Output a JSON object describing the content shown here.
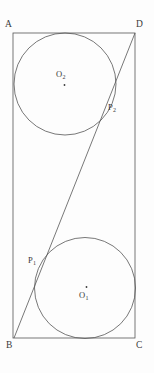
{
  "figure": {
    "type": "geometry-diagram",
    "background_color": "#fdfdfd",
    "stroke_color": "#555555",
    "stroke_width": 0.8,
    "text_color": "#3a3a3a",
    "canvas": {
      "width": 154,
      "height": 373
    }
  },
  "rectangle": {
    "name": "ABCD",
    "corners": {
      "A": {
        "x": 13,
        "y": 33
      },
      "D": {
        "x": 135,
        "y": 33
      },
      "C": {
        "x": 135,
        "y": 338
      },
      "B": {
        "x": 14,
        "y": 338
      }
    },
    "width": 122,
    "height": 305
  },
  "diagonal": {
    "name": "BD",
    "from": "B",
    "to": "D",
    "x1": 14,
    "y1": 338,
    "x2": 135,
    "y2": 33
  },
  "circles": [
    {
      "id": "O2",
      "label": "O",
      "subscript": "2",
      "cx": 65,
      "cy": 84,
      "r": 51,
      "tangent_to": [
        "AB",
        "AD",
        "BD"
      ],
      "center_dot": {
        "x": 64.5,
        "y": 85
      }
    },
    {
      "id": "O1",
      "label": "O",
      "subscript": "1",
      "cx": 85,
      "cy": 288,
      "r": 50.5,
      "tangent_to": [
        "DC",
        "BC",
        "BD"
      ],
      "center_dot": {
        "x": 86.5,
        "y": 287
      }
    }
  ],
  "tangent_points": [
    {
      "id": "P2",
      "label": "P",
      "subscript": "2",
      "x": 106,
      "y": 108
    },
    {
      "id": "P1",
      "label": "P",
      "subscript": "1",
      "x": 48,
      "y": 261
    }
  ],
  "labels": {
    "A": "A",
    "B": "B",
    "C": "C",
    "D": "D",
    "O1_base": "O",
    "O1_sub": "1",
    "O2_base": "O",
    "O2_sub": "2",
    "P1_base": "P",
    "P1_sub": "1",
    "P2_base": "P",
    "P2_sub": "2"
  }
}
